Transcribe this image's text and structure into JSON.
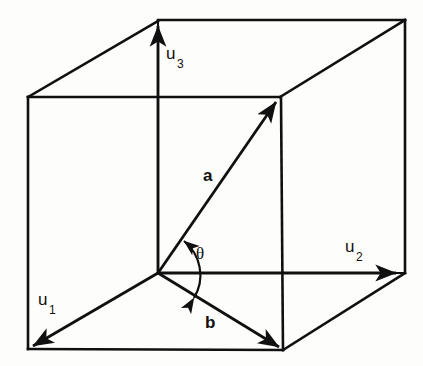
{
  "figure": {
    "kind": "geometry-diagram",
    "background_color": "#fdfdfb",
    "line_color": "#101010"
  },
  "labels": {
    "u1_base": "u",
    "u1_sub": "1",
    "u2_base": "u",
    "u2_sub": "2",
    "u3_base": "u",
    "u3_sub": "3",
    "vector_a": "a",
    "vector_b": "b",
    "angle_theta": "θ"
  },
  "geometry": {
    "origin": {
      "x": 158,
      "y": 273
    },
    "vertices": {
      "front_bottom_left": {
        "x": 28,
        "y": 349
      },
      "front_bottom_right": {
        "x": 283,
        "y": 350
      },
      "front_top_left": {
        "x": 28,
        "y": 97
      },
      "front_top_right": {
        "x": 280,
        "y": 97
      },
      "back_top_left": {
        "x": 158,
        "y": 20
      },
      "back_top_right": {
        "x": 405,
        "y": 20
      },
      "back_bottom_right": {
        "x": 405,
        "y": 273
      }
    },
    "vectors": [
      {
        "name": "u1",
        "from": {
          "x": 158,
          "y": 273
        },
        "to": {
          "x": 28,
          "y": 349
        }
      },
      {
        "name": "u2",
        "from": {
          "x": 158,
          "y": 273
        },
        "to": {
          "x": 400,
          "y": 273
        }
      },
      {
        "name": "u3",
        "from": {
          "x": 158,
          "y": 273
        },
        "to": {
          "x": 158,
          "y": 22
        }
      },
      {
        "name": "a",
        "from": {
          "x": 158,
          "y": 273
        },
        "to": {
          "x": 280,
          "y": 99
        }
      },
      {
        "name": "b",
        "from": {
          "x": 158,
          "y": 273
        },
        "to": {
          "x": 283,
          "y": 350
        }
      }
    ],
    "angle_arc": {
      "between": [
        "b",
        "a"
      ],
      "center": {
        "x": 158,
        "y": 273
      },
      "radius": 44,
      "double_headed": true
    }
  }
}
